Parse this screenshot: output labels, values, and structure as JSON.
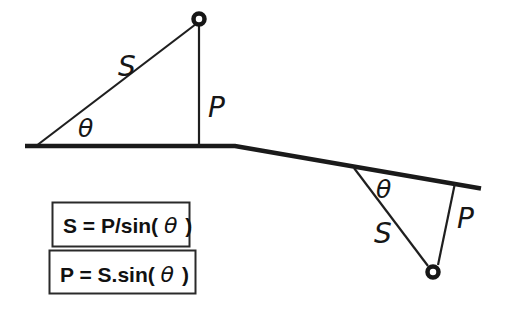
{
  "colors": {
    "background": "#ffffff",
    "ink": "#1a1a1a"
  },
  "diagram": {
    "description_labels": {
      "upper_triangle": {
        "hypotenuse_label": "S",
        "perpendicular_label": "P",
        "angle_label": "θ"
      },
      "lower_triangle": {
        "hypotenuse_label": "S",
        "perpendicular_label": "P",
        "angle_label": "θ"
      }
    },
    "formulas": [
      {
        "prefix": "S = P/sin(",
        "theta": "θ",
        "suffix": ")"
      },
      {
        "prefix": "P = S.sin(",
        "theta": "θ",
        "suffix": ")"
      }
    ]
  }
}
